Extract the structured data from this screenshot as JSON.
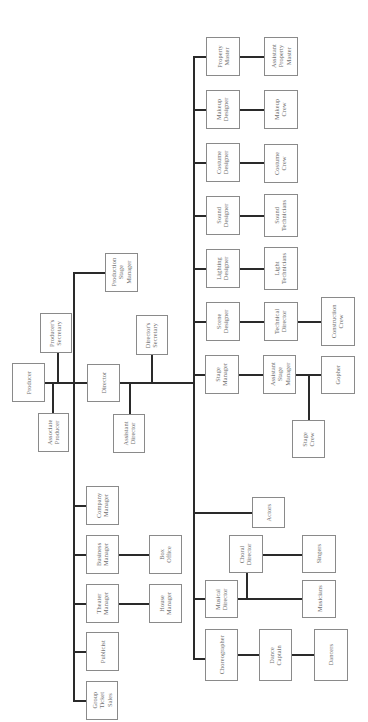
{
  "diagram": {
    "orientation": "rotated 90 degrees counter-clockwise",
    "line_color": "#2a2a2a",
    "box_border_color": "#8a8a8a",
    "text_color": "#6e6e6e",
    "nodes": [
      {
        "id": "producer",
        "label": "Producer",
        "x": 12,
        "y": 363,
        "w": 33,
        "h": 39
      },
      {
        "id": "producers_secretary",
        "label": "Producer's\nSecretary",
        "x": 40,
        "y": 313,
        "w": 32,
        "h": 40
      },
      {
        "id": "associate_producer",
        "label": "Associate\nProducer",
        "x": 38,
        "y": 413,
        "w": 31,
        "h": 39
      },
      {
        "id": "director",
        "label": "Director",
        "x": 87,
        "y": 364,
        "w": 33,
        "h": 38
      },
      {
        "id": "production_stage_manager",
        "label": "Production\nStage\nManager",
        "x": 105,
        "y": 253,
        "w": 33,
        "h": 39
      },
      {
        "id": "directors_secretary",
        "label": "Director's\nSecretary",
        "x": 136,
        "y": 315,
        "w": 32,
        "h": 40
      },
      {
        "id": "assistant_director",
        "label": "Assistant\nDirector",
        "x": 113,
        "y": 414,
        "w": 32,
        "h": 39
      },
      {
        "id": "company_manager",
        "label": "Company\nManager",
        "x": 86,
        "y": 486,
        "w": 33,
        "h": 39
      },
      {
        "id": "business_manager",
        "label": "Business\nManager",
        "x": 86,
        "y": 535,
        "w": 33,
        "h": 39
      },
      {
        "id": "theater_manager",
        "label": "Theater\nManager",
        "x": 86,
        "y": 584,
        "w": 33,
        "h": 39
      },
      {
        "id": "publicist",
        "label": "Publicist",
        "x": 86,
        "y": 632,
        "w": 33,
        "h": 39
      },
      {
        "id": "group_ticket_sales",
        "label": "Group\nTicket\nSales",
        "x": 86,
        "y": 681,
        "w": 32,
        "h": 39
      },
      {
        "id": "box_office",
        "label": "Box\nOffice",
        "x": 149,
        "y": 535,
        "w": 33,
        "h": 39
      },
      {
        "id": "house_manager",
        "label": "House\nManager",
        "x": 149,
        "y": 584,
        "w": 33,
        "h": 39
      },
      {
        "id": "property_master",
        "label": "Property\nMaster",
        "x": 206,
        "y": 37,
        "w": 34,
        "h": 39
      },
      {
        "id": "makeup_designer",
        "label": "Makeup\nDesigner",
        "x": 206,
        "y": 90,
        "w": 34,
        "h": 39
      },
      {
        "id": "costume_designer",
        "label": "Costume\nDesigner",
        "x": 206,
        "y": 143,
        "w": 34,
        "h": 39
      },
      {
        "id": "sound_designer",
        "label": "Sound\nDesigner",
        "x": 206,
        "y": 196,
        "w": 34,
        "h": 39
      },
      {
        "id": "lighting_designer",
        "label": "Lighting\nDesigner",
        "x": 206,
        "y": 249,
        "w": 34,
        "h": 39
      },
      {
        "id": "scene_designer",
        "label": "Scene\nDesigner",
        "x": 206,
        "y": 302,
        "w": 34,
        "h": 39
      },
      {
        "id": "stage_manager",
        "label": "Stage\nManager",
        "x": 205,
        "y": 355,
        "w": 34,
        "h": 39
      },
      {
        "id": "assistant_property_master",
        "label": "Assistant\nProperty\nMaster",
        "x": 264,
        "y": 37,
        "w": 34,
        "h": 39
      },
      {
        "id": "makeup_crew",
        "label": "Makeup\nCrew",
        "x": 264,
        "y": 90,
        "w": 34,
        "h": 39
      },
      {
        "id": "costume_crew",
        "label": "Costume\nCrew",
        "x": 264,
        "y": 144,
        "w": 34,
        "h": 39
      },
      {
        "id": "sound_technicians",
        "label": "Sound\nTechnicians",
        "x": 264,
        "y": 194,
        "w": 34,
        "h": 43
      },
      {
        "id": "light_technicians",
        "label": "Light\nTechnicians",
        "x": 264,
        "y": 247,
        "w": 34,
        "h": 43
      },
      {
        "id": "technical_director",
        "label": "Technical\nDirector",
        "x": 264,
        "y": 302,
        "w": 34,
        "h": 39
      },
      {
        "id": "construction_crew",
        "label": "Construction\nCrew",
        "x": 321,
        "y": 297,
        "w": 34,
        "h": 49
      },
      {
        "id": "assistant_stage_manager",
        "label": "Assistant\nStage\nManager",
        "x": 263,
        "y": 355,
        "w": 33,
        "h": 39
      },
      {
        "id": "gopher",
        "label": "Gopher",
        "x": 321,
        "y": 356,
        "w": 34,
        "h": 38
      },
      {
        "id": "stage_crew",
        "label": "Stage\nCrew",
        "x": 292,
        "y": 420,
        "w": 33,
        "h": 38
      },
      {
        "id": "actors",
        "label": "Actors",
        "x": 252,
        "y": 497,
        "w": 33,
        "h": 31
      },
      {
        "id": "choral_director",
        "label": "Choral\nDirector",
        "x": 229,
        "y": 535,
        "w": 34,
        "h": 38
      },
      {
        "id": "singers",
        "label": "Singers",
        "x": 302,
        "y": 535,
        "w": 34,
        "h": 38
      },
      {
        "id": "musical_director",
        "label": "Musical\nDirector",
        "x": 205,
        "y": 580,
        "w": 33,
        "h": 38
      },
      {
        "id": "musicians",
        "label": "Musicians",
        "x": 302,
        "y": 580,
        "w": 34,
        "h": 38
      },
      {
        "id": "choreographer",
        "label": "Choreographer",
        "x": 205,
        "y": 629,
        "w": 33,
        "h": 52
      },
      {
        "id": "dance_captain",
        "label": "Dance\nCaptain",
        "x": 259,
        "y": 629,
        "w": 33,
        "h": 52
      },
      {
        "id": "dancers",
        "label": "Dancers",
        "x": 314,
        "y": 629,
        "w": 34,
        "h": 52
      }
    ],
    "lines": [
      {
        "x": 45,
        "y": 382,
        "w": 75,
        "h": 2
      },
      {
        "x": 57,
        "y": 353,
        "w": 2,
        "h": 30
      },
      {
        "x": 52,
        "y": 383,
        "w": 2,
        "h": 30
      },
      {
        "x": 73,
        "y": 273,
        "w": 2,
        "h": 428
      },
      {
        "x": 73,
        "y": 272,
        "w": 32,
        "h": 2
      },
      {
        "x": 73,
        "y": 505,
        "w": 13,
        "h": 2
      },
      {
        "x": 73,
        "y": 554,
        "w": 13,
        "h": 2
      },
      {
        "x": 73,
        "y": 603,
        "w": 13,
        "h": 2
      },
      {
        "x": 73,
        "y": 651,
        "w": 13,
        "h": 2
      },
      {
        "x": 73,
        "y": 700,
        "w": 13,
        "h": 2
      },
      {
        "x": 119,
        "y": 554,
        "w": 30,
        "h": 2
      },
      {
        "x": 119,
        "y": 603,
        "w": 30,
        "h": 2
      },
      {
        "x": 120,
        "y": 382,
        "w": 74,
        "h": 2
      },
      {
        "x": 129,
        "y": 383,
        "w": 2,
        "h": 31
      },
      {
        "x": 151,
        "y": 355,
        "w": 2,
        "h": 28
      },
      {
        "x": 193,
        "y": 56,
        "w": 2,
        "h": 604
      },
      {
        "x": 193,
        "y": 56,
        "w": 13,
        "h": 2
      },
      {
        "x": 193,
        "y": 109,
        "w": 13,
        "h": 2
      },
      {
        "x": 193,
        "y": 162,
        "w": 13,
        "h": 2
      },
      {
        "x": 193,
        "y": 215,
        "w": 13,
        "h": 2
      },
      {
        "x": 193,
        "y": 268,
        "w": 13,
        "h": 2
      },
      {
        "x": 193,
        "y": 321,
        "w": 13,
        "h": 2
      },
      {
        "x": 193,
        "y": 374,
        "w": 12,
        "h": 2
      },
      {
        "x": 193,
        "y": 512,
        "w": 59,
        "h": 2
      },
      {
        "x": 193,
        "y": 598,
        "w": 12,
        "h": 2
      },
      {
        "x": 193,
        "y": 658,
        "w": 12,
        "h": 2
      },
      {
        "x": 240,
        "y": 56,
        "w": 24,
        "h": 2
      },
      {
        "x": 240,
        "y": 109,
        "w": 24,
        "h": 2
      },
      {
        "x": 240,
        "y": 162,
        "w": 24,
        "h": 2
      },
      {
        "x": 240,
        "y": 215,
        "w": 24,
        "h": 2
      },
      {
        "x": 240,
        "y": 268,
        "w": 24,
        "h": 2
      },
      {
        "x": 240,
        "y": 321,
        "w": 24,
        "h": 2
      },
      {
        "x": 298,
        "y": 321,
        "w": 23,
        "h": 2
      },
      {
        "x": 239,
        "y": 374,
        "w": 24,
        "h": 2
      },
      {
        "x": 296,
        "y": 374,
        "w": 25,
        "h": 2
      },
      {
        "x": 308,
        "y": 375,
        "w": 2,
        "h": 45
      },
      {
        "x": 238,
        "y": 598,
        "w": 64,
        "h": 2
      },
      {
        "x": 246,
        "y": 573,
        "w": 2,
        "h": 26
      },
      {
        "x": 263,
        "y": 554,
        "w": 39,
        "h": 2
      },
      {
        "x": 238,
        "y": 654,
        "w": 21,
        "h": 2
      },
      {
        "x": 292,
        "y": 654,
        "w": 22,
        "h": 2
      }
    ]
  }
}
